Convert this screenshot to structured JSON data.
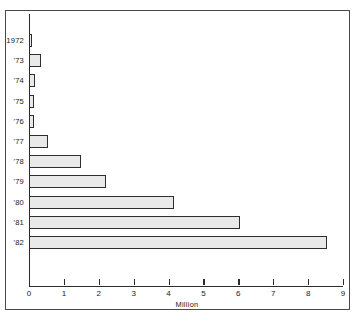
{
  "chart_data": {
    "type": "bar",
    "orientation": "horizontal",
    "title": "",
    "xlabel": "Million",
    "ylabel": "",
    "xlim": [
      0,
      9
    ],
    "xticks": [
      "0",
      "1",
      "2",
      "3",
      "4",
      "5",
      "6",
      "7",
      "8",
      "9"
    ],
    "grid": false,
    "legend": null,
    "categories": [
      "1972",
      "'73",
      "'74",
      "'75",
      "'76",
      "'77",
      "'78",
      "'79",
      "'80",
      "'81",
      "'82"
    ],
    "values": [
      0.1,
      0.35,
      0.17,
      0.15,
      0.13,
      0.55,
      1.5,
      2.2,
      4.15,
      6.05,
      8.55
    ],
    "bar_fill_color": "#e9e9e9",
    "bar_border_color": "#2e2e2e",
    "axis_color": "#2b2b2b",
    "frame_color": "#4a4a4a",
    "text_color": "#1a1a1a"
  }
}
